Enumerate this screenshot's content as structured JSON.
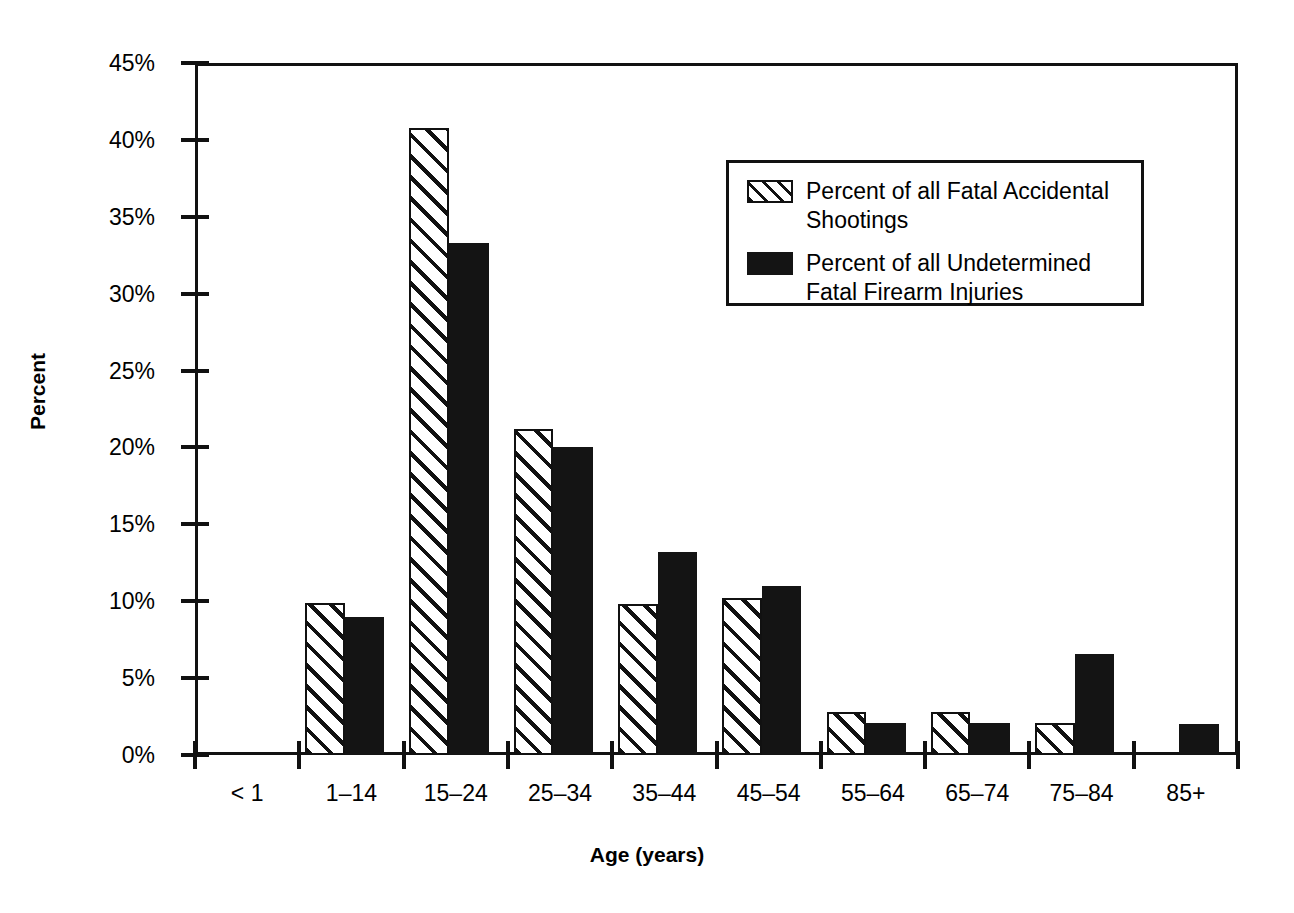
{
  "chart_data": {
    "type": "bar",
    "title": "",
    "xlabel": "Age (years)",
    "ylabel": "Percent",
    "categories": [
      "< 1",
      "1–14",
      "15–24",
      "25–34",
      "35–44",
      "45–54",
      "55–64",
      "65–74",
      "75–84",
      "85+"
    ],
    "series": [
      {
        "name": "Percent of all Fatal Accidental Shootings",
        "style": "hatched",
        "values": [
          0,
          9.9,
          40.8,
          21.2,
          9.8,
          10.2,
          2.8,
          2.8,
          2.1,
          0
        ]
      },
      {
        "name": "Percent of all Undetermined Fatal Firearm Injuries",
        "style": "solid",
        "values": [
          0,
          9.0,
          33.3,
          20.0,
          13.2,
          11.0,
          2.1,
          2.1,
          6.6,
          2.0
        ]
      }
    ],
    "ylim": [
      0,
      45
    ],
    "ytick_values": [
      0,
      5,
      10,
      15,
      20,
      25,
      30,
      35,
      40,
      45
    ],
    "ytick_labels": [
      "0%",
      "5%",
      "10%",
      "15%",
      "20%",
      "25%",
      "30%",
      "35%",
      "40%",
      "45%"
    ],
    "grid": false,
    "legend_position": "upper-center-right",
    "colors": {
      "hatched_fill": "#ffffff",
      "hatch_line": "#111111",
      "solid_fill": "#141414",
      "axis": "#111111"
    }
  },
  "legend": {
    "entries": [
      {
        "label": "Percent of all Fatal Accidental Shootings",
        "swatch": "hatched"
      },
      {
        "label": "Percent of all Undetermined Fatal Firearm Injuries",
        "swatch": "solid"
      }
    ]
  },
  "axes": {
    "y_title": "Percent",
    "x_title": "Age (years)"
  }
}
